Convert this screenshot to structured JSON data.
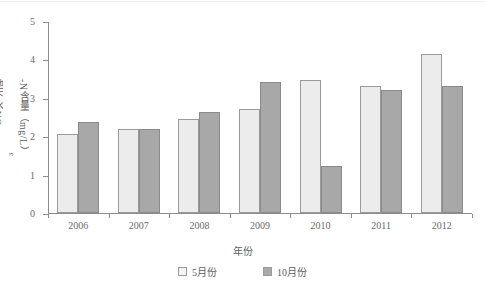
{
  "chart_data": {
    "type": "bar",
    "title": "",
    "xlabel": "年份",
    "ylabel": "地下水NO3-N含量（mg/L）",
    "ylabel_parts": {
      "prefix": "地下水NO",
      "sub": "3",
      "suffix": "-N含量（mg/L）"
    },
    "categories": [
      "2006",
      "2007",
      "2008",
      "2009",
      "2010",
      "2011",
      "2012"
    ],
    "series": [
      {
        "name": "5月份",
        "color": "#ececec",
        "values": [
          2.05,
          2.18,
          2.44,
          2.71,
          3.47,
          3.3,
          4.15
        ]
      },
      {
        "name": "10月份",
        "color": "#a8a8a8",
        "values": [
          2.38,
          2.2,
          2.64,
          3.4,
          1.22,
          3.2,
          3.32
        ]
      }
    ],
    "ylim": [
      0,
      5
    ],
    "yticks": [
      "0",
      "1",
      "2",
      "3",
      "4",
      "5"
    ],
    "grid": false,
    "legend_position": "bottom-center"
  },
  "legend": {
    "items": [
      {
        "label": "5月份",
        "swatch": "legend-swatch-may"
      },
      {
        "label": "10月份",
        "swatch": "legend-swatch-oct"
      }
    ]
  }
}
